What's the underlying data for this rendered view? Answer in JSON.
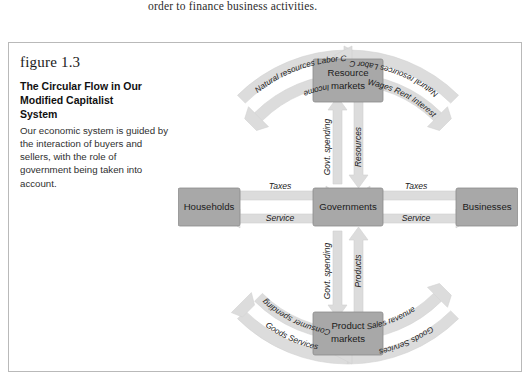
{
  "page": {
    "body_text_above": "order to finance business activities."
  },
  "figure": {
    "number_label": "figure 1.3",
    "title": "The Circular Flow in Our Modified Capitalist System",
    "title_lines": [
      "The Circular Flow in Our",
      "Modified Capitalist",
      "System"
    ],
    "description": "Our economic system is guided by the interaction of buyers and sellers, with the role of government being taken into account."
  },
  "colors": {
    "box_fill": "#a8a8a8",
    "box_stroke": "#8c8c8c",
    "arrow_fill": "#dcdcdc",
    "arrow_stroke": "#cfcfcf",
    "frame_border": "#b9b9b9",
    "text": "#1b1b1b",
    "page_background": "#ffffff"
  },
  "diagram": {
    "type": "circular-flow",
    "nodes": [
      {
        "id": "resource-markets",
        "label_lines": [
          "Resource",
          "markets"
        ],
        "label": "Resource markets",
        "position": "top"
      },
      {
        "id": "households",
        "label_lines": [
          "Households"
        ],
        "label": "Households",
        "position": "left"
      },
      {
        "id": "governments",
        "label_lines": [
          "Governments"
        ],
        "label": "Governments",
        "position": "center"
      },
      {
        "id": "businesses",
        "label_lines": [
          "Businesses"
        ],
        "label": "Businesses",
        "position": "right"
      },
      {
        "id": "product-markets",
        "label_lines": [
          "Product",
          "markets"
        ],
        "label": "Product markets",
        "position": "bottom"
      }
    ],
    "arc_flows": [
      {
        "id": "households-to-resource-outer",
        "quadrant": "upper-left",
        "ring": "outer",
        "from": "households",
        "to": "resource-markets",
        "direction": "clockwise",
        "label": "Natural resources   Labor   Capital",
        "label_words": [
          "Natural resources",
          "Labor",
          "Capital"
        ]
      },
      {
        "id": "resource-to-households-inner",
        "quadrant": "upper-left",
        "ring": "inner",
        "from": "resource-markets",
        "to": "households",
        "direction": "counter-clockwise",
        "label": "Income",
        "label_words": [
          "Income"
        ]
      },
      {
        "id": "businesses-to-resource-outer",
        "quadrant": "upper-right",
        "ring": "outer",
        "from": "businesses",
        "to": "resource-markets",
        "direction": "counter-clockwise",
        "label": "Natural resources   Labor   Capital",
        "label_words": [
          "Natural resources",
          "Labor",
          "Capital"
        ]
      },
      {
        "id": "resource-to-businesses-inner",
        "quadrant": "upper-right",
        "ring": "inner",
        "from": "resource-markets",
        "to": "businesses",
        "direction": "clockwise",
        "label": "Wages   Rent   Interest",
        "label_words": [
          "Wages",
          "Rent",
          "Interest"
        ]
      },
      {
        "id": "product-to-households-outer",
        "quadrant": "lower-left",
        "ring": "outer",
        "from": "product-markets",
        "to": "households",
        "direction": "counter-clockwise",
        "label": "Goods   Services",
        "label_words": [
          "Goods",
          "Services"
        ]
      },
      {
        "id": "households-to-product-inner",
        "quadrant": "lower-left",
        "ring": "inner",
        "from": "households",
        "to": "product-markets",
        "direction": "clockwise",
        "label": "Consumer spending",
        "label_words": [
          "Consumer spending"
        ]
      },
      {
        "id": "product-to-businesses-inner",
        "quadrant": "lower-right",
        "ring": "inner",
        "from": "product-markets",
        "to": "businesses",
        "direction": "counter-clockwise",
        "label": "Sales revenue",
        "label_words": [
          "Sales revenue"
        ]
      },
      {
        "id": "businesses-to-product-outer",
        "quadrant": "lower-right",
        "ring": "outer",
        "from": "businesses",
        "to": "product-markets",
        "direction": "clockwise",
        "label": "Goods   Services",
        "label_words": [
          "Goods",
          "Services"
        ]
      }
    ],
    "straight_flows": [
      {
        "id": "households-taxes",
        "from": "households",
        "to": "governments",
        "label": "Taxes",
        "orientation": "horizontal",
        "arrow": "right"
      },
      {
        "id": "governments-service-left",
        "from": "governments",
        "to": "households",
        "label": "Service",
        "orientation": "horizontal",
        "arrow": "left"
      },
      {
        "id": "businesses-taxes",
        "from": "businesses",
        "to": "governments",
        "label": "Taxes",
        "orientation": "horizontal",
        "arrow": "left"
      },
      {
        "id": "governments-service-right",
        "from": "governments",
        "to": "businesses",
        "label": "Service",
        "orientation": "horizontal",
        "arrow": "right"
      },
      {
        "id": "govt-spending-up",
        "from": "governments",
        "to": "resource-markets",
        "label": "Govt. spending",
        "orientation": "vertical",
        "arrow": "up"
      },
      {
        "id": "resources-down",
        "from": "resource-markets",
        "to": "governments",
        "label": "Resources",
        "orientation": "vertical",
        "arrow": "down"
      },
      {
        "id": "govt-spending-down",
        "from": "governments",
        "to": "product-markets",
        "label": "Govt. spending",
        "orientation": "vertical",
        "arrow": "down"
      },
      {
        "id": "products-up",
        "from": "product-markets",
        "to": "governments",
        "label": "Products",
        "orientation": "vertical",
        "arrow": "up"
      }
    ]
  }
}
